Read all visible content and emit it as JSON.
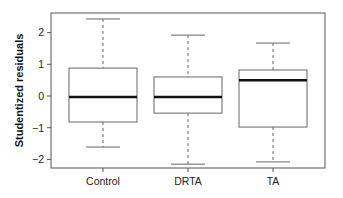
{
  "chart_data": {
    "type": "boxplot",
    "title": "",
    "xlabel": "",
    "ylabel": "Studentized residuals",
    "ylim": [
      -2.3,
      2.6
    ],
    "yticks": [
      -2,
      -1,
      0,
      1,
      2
    ],
    "ytick_labels": [
      "−2",
      "−1",
      "0",
      "1",
      "2"
    ],
    "categories": [
      "Control",
      "DRTA",
      "TA"
    ],
    "boxes": [
      {
        "name": "Control",
        "whisker_low": -1.61,
        "q1": -0.82,
        "median": -0.03,
        "q3": 0.88,
        "whisker_high": 2.43
      },
      {
        "name": "DRTA",
        "whisker_low": -2.15,
        "q1": -0.54,
        "median": -0.03,
        "q3": 0.6,
        "whisker_high": 1.92
      },
      {
        "name": "TA",
        "whisker_low": -2.08,
        "q1": -0.98,
        "median": 0.5,
        "q3": 0.82,
        "whisker_high": 1.67
      }
    ],
    "grid": false,
    "legend": null
  },
  "layout": {
    "plot": {
      "left": 51,
      "right": 325,
      "top": 13,
      "bottom": 168
    },
    "y_zero_px": 96,
    "px_per_unit": 31.7,
    "box_centers": [
      103,
      188,
      273
    ],
    "box_half_width": 34,
    "cap_half_width": 17
  },
  "colors": {
    "frame": "#555555",
    "box": "#666666",
    "median": "#111111",
    "whisker": "#666666",
    "text": "#222222"
  }
}
